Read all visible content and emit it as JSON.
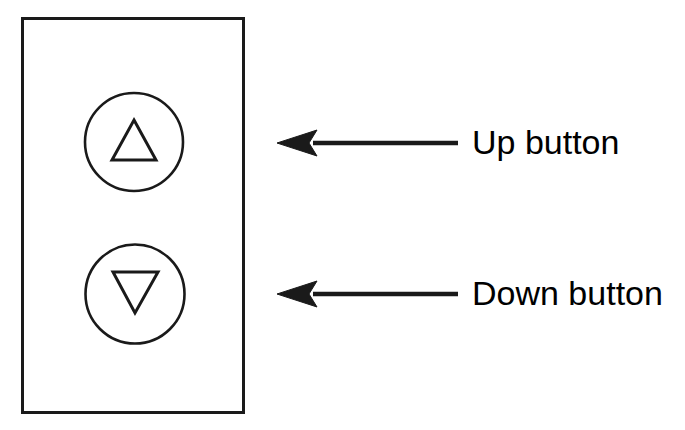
{
  "diagram": {
    "background_color": "#ffffff",
    "stroke_color": "#1a1a1a",
    "canvas": {
      "width": 685,
      "height": 430
    },
    "plate": {
      "name": "switch-plate",
      "x": 21,
      "y": 17,
      "width": 223,
      "height": 397,
      "stroke_width": 3,
      "fill": "#ffffff"
    },
    "buttons": [
      {
        "id": "up",
        "name": "up-button",
        "icon": "triangle-up-icon",
        "circle": {
          "cx": 134,
          "cy": 142,
          "r": 49,
          "stroke_width": 2.6
        },
        "triangle": {
          "points": "134,120 156,160 112,160",
          "stroke_width": 3
        }
      },
      {
        "id": "down",
        "name": "down-button",
        "icon": "triangle-down-icon",
        "circle": {
          "cx": 135,
          "cy": 294,
          "r": 49.5,
          "stroke_width": 2.6
        },
        "triangle": {
          "points": "113,272 158,272 135,313",
          "stroke_width": 3
        }
      }
    ],
    "callouts": [
      {
        "id": "up",
        "label": "Up button",
        "arrow": {
          "tip_x": 277,
          "tail_x": 458,
          "y": 143,
          "shaft_width": 4.5,
          "head_length": 36,
          "head_half_height": 13
        }
      },
      {
        "id": "down",
        "label": "Down button",
        "arrow": {
          "tip_x": 277,
          "tail_x": 458,
          "y": 294,
          "shaft_width": 4.5,
          "head_length": 36,
          "head_half_height": 13
        }
      }
    ]
  }
}
